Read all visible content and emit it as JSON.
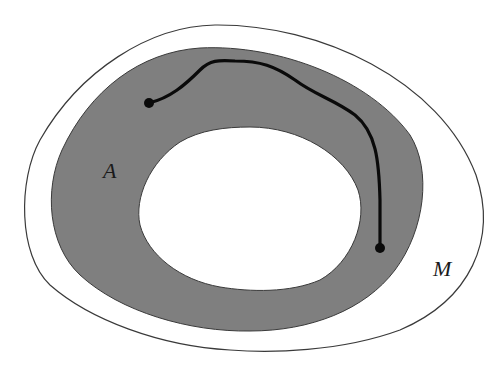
{
  "diagram": {
    "labels": {
      "region": "A",
      "manifold": "M"
    },
    "colors": {
      "background": "#ffffff",
      "region_fill": "#7f7f7f",
      "outline": "#3a3a3a",
      "path": "#0a0a0a"
    },
    "elements": [
      {
        "id": "manifold-M",
        "type": "closed-curve",
        "label": "M"
      },
      {
        "id": "region-A",
        "type": "annulus",
        "label": "A",
        "fill": "gray"
      },
      {
        "id": "hole",
        "type": "closed-curve",
        "fill": "white"
      },
      {
        "id": "path",
        "type": "curve",
        "start_point": "dot",
        "end_point": "dot"
      }
    ]
  }
}
